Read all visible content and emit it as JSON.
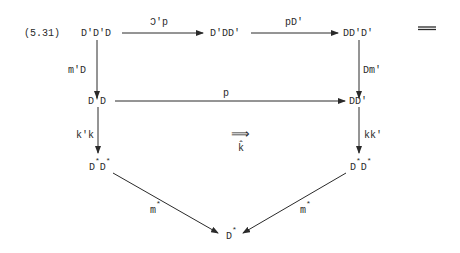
{
  "equation_number": "(5.31)",
  "nodes": {
    "top_left": "D'D'D",
    "top_mid": "D'DD'",
    "top_right": "DD'D'",
    "mid_left": "D'D",
    "mid_right": "DD'",
    "bot_left_a": "D",
    "bot_left_b": "D",
    "bot_right_a": "D",
    "bot_right_b": "D",
    "bottom": "D",
    "star": "*"
  },
  "arrows": {
    "top_left_to_top_mid": "Ɔ'p",
    "top_mid_to_top_right": "pD'",
    "top_left_down": "m'D",
    "top_right_down": "Dm'",
    "mid_horizontal": "p",
    "mid_left_down": "k'k",
    "mid_right_down": "kk'",
    "left_diag": "m",
    "right_diag": "m",
    "twocell": "⟹",
    "twocell_label": "k̂"
  },
  "trailing_symbol": "="
}
